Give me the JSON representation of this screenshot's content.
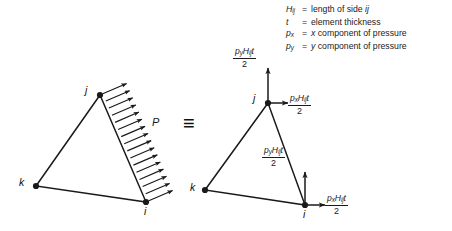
{
  "legend": {
    "rows": [
      {
        "symbol": "H",
        "symbol_sub": "ij",
        "equals": "=",
        "text": "length of side ij"
      },
      {
        "symbol": "t",
        "symbol_sub": "",
        "equals": "=",
        "text": "element thickness"
      },
      {
        "symbol": "p",
        "symbol_sub": "x",
        "equals": "=",
        "text": "x component of pressure"
      },
      {
        "symbol": "p",
        "symbol_sub": "y",
        "equals": "=",
        "text": "y component of pressure"
      }
    ]
  },
  "identity_symbol": "≡",
  "left_diagram": {
    "name": "distributed-pressure-triangle",
    "nodes": [
      {
        "id": "j",
        "label": "j",
        "x": 100,
        "y": 95,
        "label_x": 85,
        "label_y": 86
      },
      {
        "id": "k",
        "label": "k",
        "x": 36,
        "y": 186,
        "label_x": 19,
        "label_y": 178
      },
      {
        "id": "i",
        "label": "i",
        "x": 146,
        "y": 202,
        "label_x": 144,
        "label_y": 206
      }
    ],
    "pressure_label": "P",
    "pressure_arrow_count": 16,
    "loaded_edge": "ji"
  },
  "right_diagram": {
    "name": "equivalent-nodal-forces-triangle",
    "nodes": [
      {
        "id": "j",
        "label": "j",
        "x": 268,
        "y": 103,
        "label_x": 253,
        "label_y": 94
      },
      {
        "id": "k",
        "label": "k",
        "x": 205,
        "y": 190,
        "label_x": 190,
        "label_y": 183
      },
      {
        "id": "i",
        "label": "i",
        "x": 305,
        "y": 205,
        "label_x": 303,
        "label_y": 209
      }
    ],
    "forces": [
      {
        "id": "j-vertical",
        "numerator": "pyHijt",
        "denominator": "2",
        "direction": "up",
        "at_node": "j",
        "num_parts": {
          "p": "p",
          "p_sub": "y",
          "H": "H",
          "H_sub": "ij",
          "t": "t"
        },
        "label_x": 237,
        "label_y": 49
      },
      {
        "id": "j-horizontal",
        "numerator": "pxHijt",
        "denominator": "2",
        "direction": "right",
        "at_node": "j",
        "num_parts": {
          "p": "p",
          "p_sub": "x",
          "H": "H",
          "H_sub": "ij",
          "t": "t"
        },
        "label_x": 290,
        "label_y": 96
      },
      {
        "id": "i-vertical",
        "numerator": "pyHijt",
        "denominator": "2",
        "direction": "up",
        "at_node": "i",
        "num_parts": {
          "p": "p",
          "p_sub": "y",
          "H": "H",
          "H_sub": "ij",
          "t": "t"
        },
        "label_x": 264,
        "label_y": 148
      },
      {
        "id": "i-horizontal",
        "numerator": "pxHijt",
        "denominator": "2",
        "direction": "right",
        "at_node": "i",
        "num_parts": {
          "p": "p",
          "p_sub": "x",
          "H": "H",
          "H_sub": "ij",
          "t": "t"
        },
        "label_x": 327,
        "label_y": 196
      }
    ]
  },
  "colors": {
    "stroke": "#1a1a1a",
    "background": "#ffffff",
    "text": "#1a1a1a"
  }
}
